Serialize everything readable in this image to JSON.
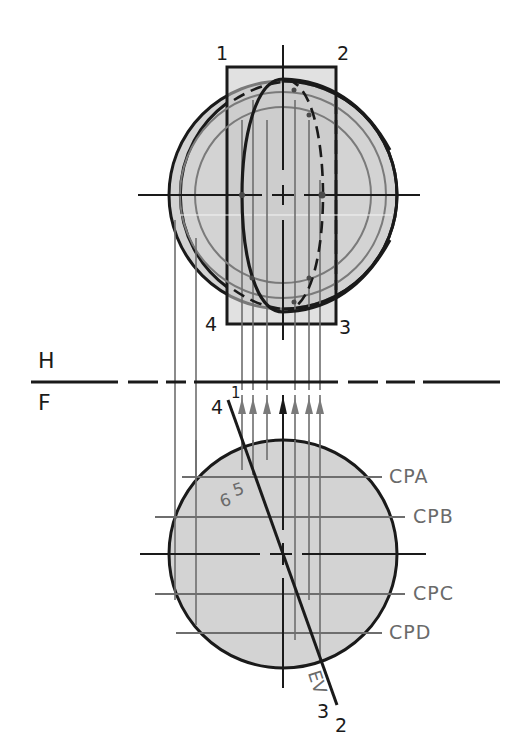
{
  "figure": {
    "type": "descriptive geometry: sphere cut by edge-view plane, top (H) and front (F) views",
    "fold_line": {
      "upper_label": "H",
      "lower_label": "F"
    },
    "top_view": {
      "corner_labels": [
        "1",
        "2",
        "3",
        "4"
      ]
    },
    "front_view": {
      "cutting_plane_labels": [
        "CPA",
        "CPB",
        "CPC",
        "CPD"
      ],
      "edge_view_label": "EV",
      "edge_end_labels": {
        "top_outer": "4",
        "top_inner": "1",
        "bottom_outer": "3",
        "bottom_inner": "2"
      },
      "point_labels": [
        "6",
        "5"
      ]
    },
    "colors": {
      "line_dark": "#1a1a1a",
      "line_grey": "#6e6e6e",
      "fill_sphere": "#d3d3d3",
      "fill_plane": "#c9c9c9"
    }
  }
}
